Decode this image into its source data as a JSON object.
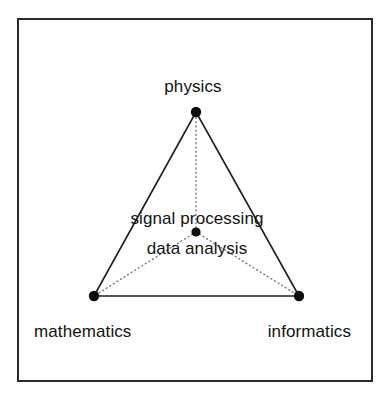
{
  "figure": {
    "type": "triangle-relationship-diagram",
    "background_color": "#ffffff",
    "frame": {
      "name": "outer-border",
      "x": 18,
      "y": 19,
      "width": 354,
      "height": 362,
      "stroke_color": "#2b2b2b",
      "stroke_width": 1.4
    },
    "edge_style": {
      "stroke_color": "#1f1f1f",
      "stroke_width": 1.6
    },
    "connector_style": {
      "stroke_color": "#7a7a7a",
      "stroke_width": 1.4,
      "dash": "1,3.2"
    },
    "vertex_style": {
      "fill": "#0d0d0d",
      "radius": 5.2
    },
    "center_style": {
      "fill": "#0d0d0d",
      "radius": 4.6
    }
  },
  "vertices": [
    {
      "id": "physics",
      "label": "physics",
      "x": 196,
      "y": 112,
      "label_x": 193,
      "label_y": 92,
      "label_anchor": "middle"
    },
    {
      "id": "mathematics",
      "label": "mathematics",
      "x": 94,
      "y": 296,
      "label_x": 34,
      "label_y": 337,
      "label_anchor": "start"
    },
    {
      "id": "informatics",
      "label": "informatics",
      "x": 299,
      "y": 296,
      "label_x": 351,
      "label_y": 337,
      "label_anchor": "end"
    }
  ],
  "center": {
    "id": "center-node",
    "x": 196,
    "y": 232,
    "label_line_1": "signal processing",
    "label_line_2": "data analysis",
    "label_1_x": 197,
    "label_1_y": 224,
    "label_2_x": 197,
    "label_2_y": 254
  },
  "edges": [
    {
      "id": "edge-physics-mathematics",
      "from": "physics",
      "to": "mathematics"
    },
    {
      "id": "edge-physics-informatics",
      "from": "physics",
      "to": "informatics"
    },
    {
      "id": "edge-mathematics-informatics",
      "from": "mathematics",
      "to": "informatics"
    }
  ],
  "connectors": [
    {
      "id": "connector-center-physics",
      "from": "center",
      "to": "physics"
    },
    {
      "id": "connector-center-mathematics",
      "from": "center",
      "to": "mathematics"
    },
    {
      "id": "connector-center-informatics",
      "from": "center",
      "to": "informatics"
    }
  ]
}
